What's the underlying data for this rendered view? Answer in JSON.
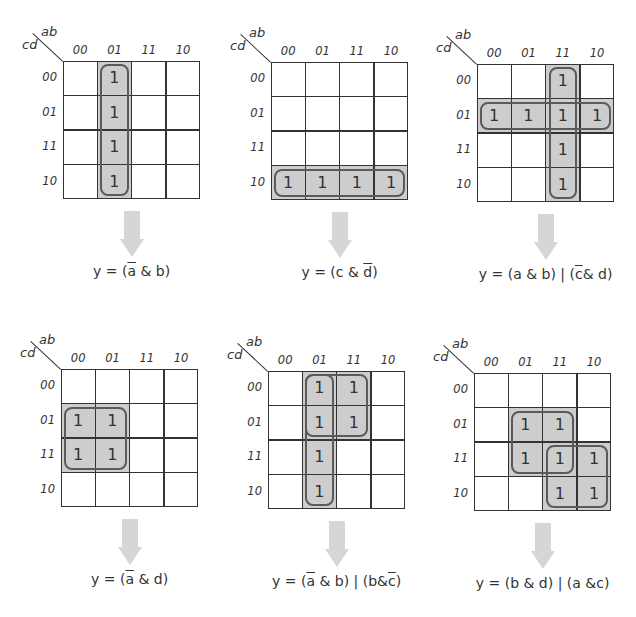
{
  "axis_labels": {
    "columns_var": "ab",
    "rows_var": "cd"
  },
  "column_headers": [
    "00",
    "01",
    "11",
    "10"
  ],
  "row_headers": [
    "00",
    "01",
    "11",
    "10"
  ],
  "colors": {
    "grid_line": "#333333",
    "shading": "#cdcdcd",
    "loop_border": "#5a5a5a",
    "arrow": "#d6d6d6",
    "text": "#333333"
  },
  "maps": [
    {
      "id": "map1",
      "origin": [
        63,
        61
      ],
      "ones": [
        [
          0,
          1
        ],
        [
          1,
          1
        ],
        [
          2,
          1
        ],
        [
          3,
          1
        ]
      ],
      "shades": [
        {
          "r": 0,
          "c": 1,
          "rs": 4,
          "cs": 1
        }
      ],
      "loops": [
        {
          "r": 0,
          "c": 1,
          "rs": 4,
          "cs": 1
        }
      ],
      "equation": [
        {
          "t": "y = ("
        },
        {
          "t": "a",
          "ov": true
        },
        {
          "t": " & b)"
        }
      ],
      "equation_text": "y = (a̅ & b)"
    },
    {
      "id": "map2",
      "origin": [
        271,
        62
      ],
      "ones": [
        [
          3,
          0
        ],
        [
          3,
          1
        ],
        [
          3,
          2
        ],
        [
          3,
          3
        ]
      ],
      "shades": [
        {
          "r": 3,
          "c": 0,
          "rs": 1,
          "cs": 4
        }
      ],
      "loops": [
        {
          "r": 3,
          "c": 0,
          "rs": 1,
          "cs": 4
        }
      ],
      "equation": [
        {
          "t": "y = (c & "
        },
        {
          "t": "d",
          "ov": true
        },
        {
          "t": ")"
        }
      ],
      "equation_text": "y = (c & d̅)"
    },
    {
      "id": "map3",
      "origin": [
        477,
        64
      ],
      "ones": [
        [
          0,
          2
        ],
        [
          1,
          0
        ],
        [
          1,
          1
        ],
        [
          1,
          2
        ],
        [
          1,
          3
        ],
        [
          2,
          2
        ],
        [
          3,
          2
        ]
      ],
      "shades": [
        {
          "r": 0,
          "c": 2,
          "rs": 4,
          "cs": 1
        },
        {
          "r": 1,
          "c": 0,
          "rs": 1,
          "cs": 4
        }
      ],
      "loops": [
        {
          "r": 0,
          "c": 2,
          "rs": 4,
          "cs": 1
        },
        {
          "r": 1,
          "c": 0,
          "rs": 1,
          "cs": 4
        }
      ],
      "equation": [
        {
          "t": "y = (a & b) | ("
        },
        {
          "t": "c",
          "ov": true
        },
        {
          "t": "& d)"
        }
      ],
      "equation_text": "y = (a & b) | (c̅ & d)"
    },
    {
      "id": "map4",
      "origin": [
        61,
        369
      ],
      "ones": [
        [
          1,
          0
        ],
        [
          1,
          1
        ],
        [
          2,
          0
        ],
        [
          2,
          1
        ]
      ],
      "shades": [
        {
          "r": 1,
          "c": 0,
          "rs": 2,
          "cs": 2
        }
      ],
      "loops": [
        {
          "r": 1,
          "c": 0,
          "rs": 2,
          "cs": 2
        }
      ],
      "equation": [
        {
          "t": "y = ("
        },
        {
          "t": "a",
          "ov": true
        },
        {
          "t": " & d)"
        }
      ],
      "equation_text": "y = (a̅ & d)"
    },
    {
      "id": "map5",
      "origin": [
        268,
        371
      ],
      "ones": [
        [
          0,
          1
        ],
        [
          0,
          2
        ],
        [
          1,
          1
        ],
        [
          1,
          2
        ],
        [
          2,
          1
        ],
        [
          3,
          1
        ]
      ],
      "shades": [
        {
          "r": 0,
          "c": 1,
          "rs": 4,
          "cs": 1
        },
        {
          "r": 0,
          "c": 2,
          "rs": 2,
          "cs": 1
        }
      ],
      "loops": [
        {
          "r": 0,
          "c": 1,
          "rs": 4,
          "cs": 1
        },
        {
          "r": 0,
          "c": 1,
          "rs": 2,
          "cs": 2
        }
      ],
      "equation": [
        {
          "t": "y = ("
        },
        {
          "t": "a",
          "ov": true
        },
        {
          "t": " & b) | (b&"
        },
        {
          "t": "c",
          "ov": true
        },
        {
          "t": ")"
        }
      ],
      "equation_text": "y = (a̅ & b) | (b & c̅)"
    },
    {
      "id": "map6",
      "origin": [
        474,
        373
      ],
      "ones": [
        [
          1,
          1
        ],
        [
          1,
          2
        ],
        [
          2,
          1
        ],
        [
          2,
          2
        ],
        [
          2,
          3
        ],
        [
          3,
          2
        ],
        [
          3,
          3
        ]
      ],
      "shades": [
        {
          "r": 1,
          "c": 1,
          "rs": 2,
          "cs": 2
        },
        {
          "r": 2,
          "c": 2,
          "rs": 2,
          "cs": 2
        }
      ],
      "loops": [
        {
          "r": 1,
          "c": 1,
          "rs": 2,
          "cs": 2
        },
        {
          "r": 2,
          "c": 2,
          "rs": 2,
          "cs": 2
        }
      ],
      "equation": [
        {
          "t": "y = (b & d) | (a &c)"
        }
      ],
      "equation_text": "y = (b & d) | (a & c)"
    }
  ]
}
